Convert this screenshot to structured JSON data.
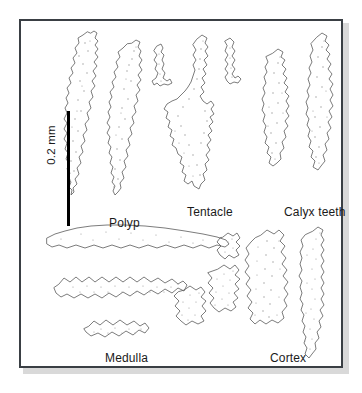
{
  "figure": {
    "kind": "scientific-line-drawing",
    "background_color": "#ffffff",
    "frame_color": "#3a3f44",
    "ink_color": "#5a5a5a",
    "label_color": "#1a1a1a"
  },
  "scale_bar": {
    "label": "0.2 mm",
    "orientation": "vertical",
    "rotation_deg": -90,
    "color": "#000000"
  },
  "labels": {
    "polyp": "Polyp",
    "tentacle": "Tentacle",
    "calyx_teeth": "Calyx teeth",
    "medulla": "Medulla",
    "cortex": "Cortex"
  },
  "groups": [
    {
      "name": "polyp",
      "label": "Polyp",
      "row": "top",
      "sclerite_count": 2,
      "form": "elongate curved spindles with tuberculate margins and stippled interiors"
    },
    {
      "name": "tentacle",
      "label": "Tentacle",
      "row": "top",
      "sclerite_count": 3,
      "form": "small rods plus a large branched antler-like sclerite"
    },
    {
      "name": "calyx_teeth",
      "label": "Calyx teeth",
      "row": "top",
      "sclerite_count": 2,
      "form": "stout spiny clubs with strongly warted outlines"
    },
    {
      "name": "medulla",
      "label": "Medulla",
      "row": "bottom",
      "sclerite_count": 3,
      "form": "horizontal rods, one long and slender, two shorter and spiny"
    },
    {
      "name": "cortex",
      "label": "Cortex",
      "row": "bottom",
      "sclerite_count": 5,
      "form": "irregular knobby clumps and elongate warty spindles"
    }
  ]
}
